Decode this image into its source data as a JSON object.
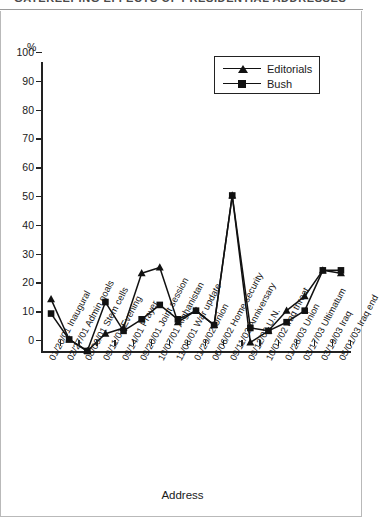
{
  "figure": {
    "title_partial": "GATEKEEPING EFFECTS OF PRESIDENTIAL ADDRESSES",
    "percent_sign": "%",
    "xaxis_title": "Address"
  },
  "legend": {
    "position": "top-right-inside",
    "entries": [
      {
        "label": "Editorials",
        "marker": "triangle",
        "color": "#111111"
      },
      {
        "label": "Bush",
        "marker": "square",
        "color": "#111111"
      }
    ]
  },
  "chart_data": {
    "type": "line",
    "title": "GATEKEEPING EFFECTS OF PRESIDENTIAL ADDRESSES",
    "xlabel": "Address",
    "ylabel": "%",
    "ylim": [
      0,
      100
    ],
    "yticks": [
      0,
      10,
      20,
      30,
      40,
      50,
      60,
      70,
      80,
      90,
      100
    ],
    "ytick_labels": [
      "0",
      "10",
      "20",
      "30",
      "40",
      "50",
      "60",
      "70",
      "80",
      "90",
      "100"
    ],
    "grid": false,
    "categories": [
      "01/20/01 Inaugural",
      "02/27/01 Admin goals",
      "08/09/01 Stem cells",
      "09/11/01 Evening",
      "09/14/01 Prayer",
      "09/20/01 Joint session",
      "10/07/01 Afghanistan",
      "11/08/01 War update",
      "01/29/02 Union",
      "06/06/02 Home security",
      "09/11/02 Anniversary",
      "09/12/02 U.N.",
      "10/07/02 Iraq threat",
      "01/28/03 Union",
      "03/17/03 Ultimatum",
      "03/19/03 Iraq",
      "05/01/03 Iraq end"
    ],
    "series": [
      {
        "name": "Editorials",
        "marker": "triangle",
        "color": "#111111",
        "values": [
          18,
          4,
          0,
          6,
          8,
          27,
          29,
          10,
          14,
          9,
          54,
          3,
          7,
          14,
          19,
          28,
          27
        ]
      },
      {
        "name": "Bush",
        "marker": "square",
        "color": "#111111",
        "values": [
          13,
          4,
          0,
          17,
          7,
          11,
          16,
          11,
          14,
          9,
          54,
          8,
          7,
          10,
          14,
          28,
          28
        ]
      }
    ]
  }
}
